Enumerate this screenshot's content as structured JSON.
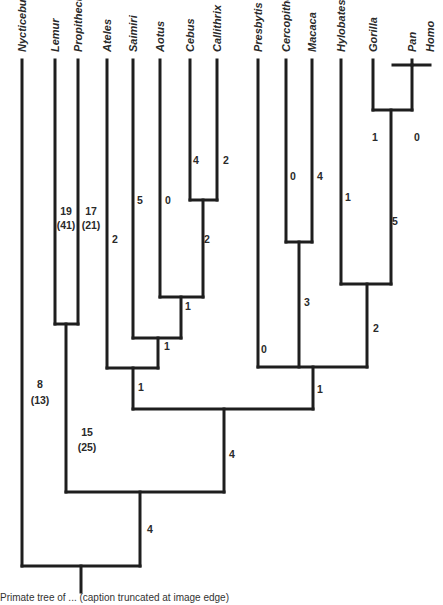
{
  "figure": {
    "type": "phylogenetic-tree",
    "taxa": [
      {
        "name": "Nycticebus",
        "x": 22
      },
      {
        "name": "Lemur",
        "x": 55
      },
      {
        "name": "Propithecus",
        "x": 78
      },
      {
        "name": "Ateles",
        "x": 107
      },
      {
        "name": "Saimiri",
        "x": 133
      },
      {
        "name": "Aotus",
        "x": 160
      },
      {
        "name": "Cebus",
        "x": 190
      },
      {
        "name": "Callithrix",
        "x": 217
      },
      {
        "name": "Presbytis",
        "x": 258
      },
      {
        "name": "Cercopithecus",
        "x": 286
      },
      {
        "name": "Macaca",
        "x": 312
      },
      {
        "name": "Hylobates",
        "x": 341
      },
      {
        "name": "Gorilla",
        "x": 373
      },
      {
        "name": "Pan",
        "x": 412
      },
      {
        "name": "Homo",
        "x": 430
      }
    ],
    "branch_labels": [
      {
        "text": "8",
        "x": 40,
        "y": 388
      },
      {
        "text": "(13)",
        "x": 40,
        "y": 404
      },
      {
        "text": "19",
        "x": 66,
        "y": 215
      },
      {
        "text": "(41)",
        "x": 66,
        "y": 229
      },
      {
        "text": "17",
        "x": 91,
        "y": 215
      },
      {
        "text": "(21)",
        "x": 91,
        "y": 229
      },
      {
        "text": "2",
        "x": 115,
        "y": 243
      },
      {
        "text": "5",
        "x": 140,
        "y": 204
      },
      {
        "text": "0",
        "x": 168,
        "y": 204
      },
      {
        "text": "4",
        "x": 196,
        "y": 164
      },
      {
        "text": "2",
        "x": 226,
        "y": 164
      },
      {
        "text": "2",
        "x": 207,
        "y": 243
      },
      {
        "text": "1",
        "x": 188,
        "y": 310
      },
      {
        "text": "1",
        "x": 167,
        "y": 350
      },
      {
        "text": "1",
        "x": 141,
        "y": 391
      },
      {
        "text": "0",
        "x": 264,
        "y": 353
      },
      {
        "text": "0",
        "x": 293,
        "y": 180
      },
      {
        "text": "4",
        "x": 320,
        "y": 180
      },
      {
        "text": "3",
        "x": 307,
        "y": 306
      },
      {
        "text": "1",
        "x": 348,
        "y": 201
      },
      {
        "text": "1",
        "x": 375,
        "y": 141
      },
      {
        "text": "0",
        "x": 417,
        "y": 141
      },
      {
        "text": "5",
        "x": 395,
        "y": 225
      },
      {
        "text": "2",
        "x": 376,
        "y": 332
      },
      {
        "text": "1",
        "x": 320,
        "y": 393
      },
      {
        "text": "15",
        "x": 87,
        "y": 436
      },
      {
        "text": "(25)",
        "x": 87,
        "y": 451
      },
      {
        "text": "4",
        "x": 232,
        "y": 458
      },
      {
        "text": "4",
        "x": 150,
        "y": 533
      }
    ],
    "caption": "Primate tree of ... (caption truncated at image edge)"
  }
}
